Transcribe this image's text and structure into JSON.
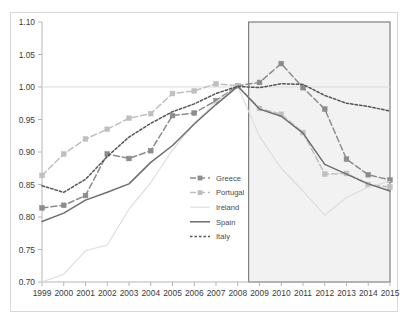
{
  "chart_data": {
    "type": "line",
    "title": "",
    "xlabel": "",
    "ylabel": "",
    "x": [
      1999,
      2000,
      2001,
      2002,
      2003,
      2004,
      2005,
      2006,
      2007,
      2008,
      2009,
      2010,
      2011,
      2012,
      2013,
      2014,
      2015
    ],
    "categories": [
      "1999",
      "2000",
      "2001",
      "2002",
      "2003",
      "2004",
      "2005",
      "2006",
      "2007",
      "2008",
      "2009",
      "2010",
      "2011",
      "2012",
      "2013",
      "2014",
      "2015"
    ],
    "ylim": [
      0.7,
      1.1
    ],
    "ytick_values": [
      0.7,
      0.75,
      0.8,
      0.85,
      0.9,
      0.95,
      1.0,
      1.05,
      1.1
    ],
    "ytick_labels": [
      "0.70",
      "0.75",
      "0.80",
      "0.85",
      "0.90",
      "0.95",
      "1.00",
      "1.05",
      "1.10"
    ],
    "grid": false,
    "reference_line": 1.0,
    "legend_position": "center",
    "shaded_region": {
      "label": "",
      "x_start": 2008.5,
      "x_end": 2015,
      "fill": "#f2f2f2",
      "border": "#7f7f7f"
    },
    "series": [
      {
        "name": "Greece",
        "color": "#8c8c8c",
        "style": "dashed",
        "marker": "square",
        "values": [
          0.814,
          0.818,
          0.833,
          0.897,
          0.89,
          0.902,
          0.956,
          0.96,
          0.979,
          1.002,
          1.007,
          1.036,
          0.999,
          0.966,
          0.889,
          0.865,
          0.857
        ]
      },
      {
        "name": "Portugal",
        "color": "#bfbfbf",
        "style": "dashed",
        "marker": "square",
        "values": [
          0.864,
          0.897,
          0.92,
          0.935,
          0.952,
          0.959,
          0.99,
          0.994,
          1.005,
          1.002,
          0.967,
          0.958,
          0.93,
          0.866,
          0.867,
          0.85,
          0.846
        ]
      },
      {
        "name": "Ireland",
        "color": "#dcdcdc",
        "style": "solid",
        "marker": "none",
        "values": [
          0.7,
          0.712,
          0.748,
          0.757,
          0.812,
          0.853,
          0.903,
          0.944,
          0.977,
          1.001,
          0.924,
          0.875,
          0.84,
          0.803,
          0.83,
          0.846,
          0.855
        ]
      },
      {
        "name": "Spain",
        "color": "#6e6e6e",
        "style": "solid",
        "marker": "none",
        "values": [
          0.793,
          0.806,
          0.826,
          0.838,
          0.851,
          0.884,
          0.91,
          0.943,
          0.973,
          1.001,
          0.966,
          0.955,
          0.929,
          0.881,
          0.866,
          0.851,
          0.84
        ]
      },
      {
        "name": "Italy",
        "color": "#555555",
        "style": "dotted",
        "marker": "none",
        "values": [
          0.848,
          0.838,
          0.858,
          0.893,
          0.923,
          0.944,
          0.962,
          0.974,
          0.99,
          1.001,
          0.999,
          1.005,
          1.004,
          0.987,
          0.975,
          0.97,
          0.963
        ]
      }
    ]
  },
  "legend": {
    "items": [
      {
        "label": "Greece"
      },
      {
        "label": "Portugal"
      },
      {
        "label": "Ireland"
      },
      {
        "label": "Spain"
      },
      {
        "label": "Italy"
      }
    ]
  }
}
